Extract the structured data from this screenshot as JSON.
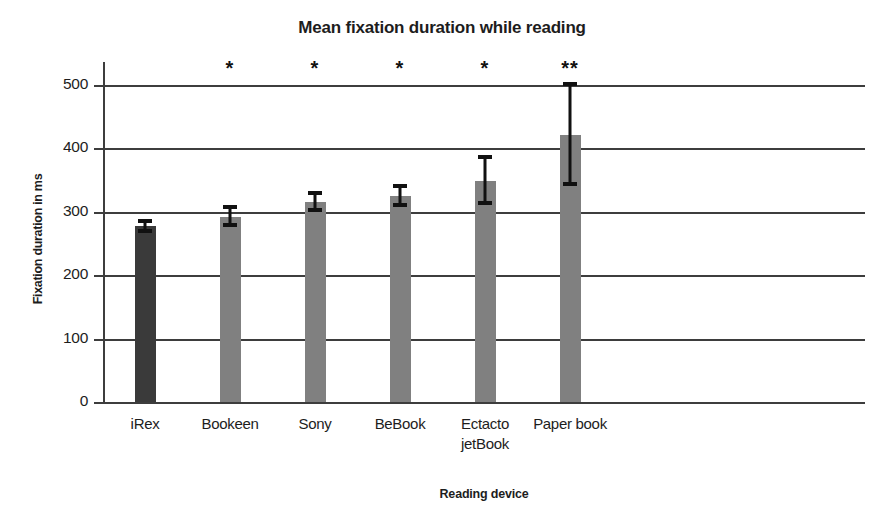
{
  "chart_data": {
    "type": "bar",
    "title": "Mean fixation duration while reading",
    "xlabel": "Reading device",
    "ylabel": "Fixation duration in ms",
    "categories": [
      "iRex",
      "Bookeen",
      "Sony",
      "BeBook",
      "Ectacto jetBook",
      "Paper book"
    ],
    "values": [
      277,
      292,
      315,
      325,
      348,
      421
    ],
    "error_low": [
      267,
      276,
      300,
      308,
      311,
      341
    ],
    "error_high": [
      288,
      310,
      333,
      344,
      390,
      504
    ],
    "annotations": [
      "",
      "*",
      "*",
      "*",
      "*",
      "**"
    ],
    "ylim": [
      0,
      500
    ],
    "yticks": [
      0,
      100,
      200,
      300,
      400,
      500
    ],
    "ytick_labels": [
      "0",
      "100",
      "200",
      "300",
      "400",
      "500"
    ],
    "grid": true,
    "legend": "none",
    "bar_colors": [
      "#3a3a3a",
      "#808080",
      "#808080",
      "#808080",
      "#808080",
      "#808080"
    ],
    "highlight_color": "#3a3a3a",
    "bar_color": "#808080",
    "axis_color": "#3d3d3d",
    "error_color": "#111111",
    "series": [
      {
        "name": "Mean fixation duration",
        "values": [
          277,
          292,
          315,
          325,
          348,
          421
        ]
      }
    ],
    "points": [
      {
        "category": "iRex",
        "value": 277,
        "error_low": 267,
        "error_high": 288,
        "significance": ""
      },
      {
        "category": "Bookeen",
        "value": 292,
        "error_low": 276,
        "error_high": 310,
        "significance": "*"
      },
      {
        "category": "Sony",
        "value": 315,
        "error_low": 300,
        "error_high": 333,
        "significance": "*"
      },
      {
        "category": "BeBook",
        "value": 325,
        "error_low": 308,
        "error_high": 344,
        "significance": "*"
      },
      {
        "category": "Ectacto jetBook",
        "value": 348,
        "error_low": 311,
        "error_high": 390,
        "significance": "*"
      },
      {
        "category": "Paper book",
        "value": 421,
        "error_low": 341,
        "error_high": 504,
        "significance": "**"
      }
    ],
    "category_label_lines": [
      [
        "iRex"
      ],
      [
        "Bookeen"
      ],
      [
        "Sony"
      ],
      [
        "BeBook"
      ],
      [
        "Ectacto",
        "jetBook"
      ],
      [
        "Paper book"
      ]
    ]
  }
}
